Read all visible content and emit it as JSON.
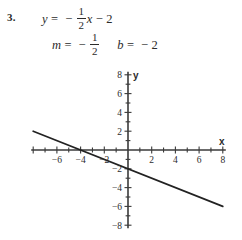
{
  "problem": {
    "number": "3.",
    "equation": {
      "lhs": "y",
      "equals": "=",
      "minus": "−",
      "frac_numerator": "1",
      "frac_denominator": "2",
      "variable": "x",
      "minus2": "−",
      "constant": "2"
    },
    "slope_intercept": {
      "m_symbol": "m",
      "m_equals": "=",
      "m_minus": "−",
      "m_numerator": "1",
      "m_denominator": "2",
      "b_symbol": "b",
      "b_equals": "=",
      "b_minus": "−",
      "b_value": "2"
    }
  },
  "chart_data": {
    "type": "line",
    "title": "",
    "xlabel": "x",
    "ylabel": "y",
    "xlim": [
      -8,
      8
    ],
    "ylim": [
      -8,
      8
    ],
    "grid": false,
    "legend": "none",
    "x_ticks": [
      -8,
      -6,
      -4,
      -2,
      2,
      4,
      6,
      8
    ],
    "x_tick_labels": [
      "",
      "−6",
      "−4",
      "−2",
      "2",
      "4",
      "6",
      "8"
    ],
    "y_ticks": [
      -8,
      -6,
      -4,
      -2,
      2,
      4,
      6,
      8
    ],
    "y_tick_labels": [
      "−8",
      "−6",
      "−4",
      "−2",
      "2",
      "4",
      "6",
      "8"
    ],
    "minor_tick_step": 1,
    "series": [
      {
        "name": "y = -1/2 x - 2",
        "slope": -0.5,
        "intercept": -2,
        "x": [
          -8,
          8
        ],
        "values": [
          2,
          -6
        ],
        "color": "#222222"
      }
    ],
    "x_intercept": -4,
    "y_intercept": -2
  },
  "colors": {
    "axis": "#3a3a3a",
    "line": "#222222",
    "text": "#2b2b2b",
    "background": "#ffffff"
  }
}
